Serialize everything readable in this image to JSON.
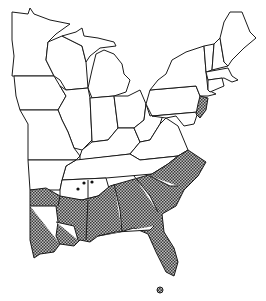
{
  "map": {
    "title": "Eastern United States range map",
    "legend": {
      "shaded_label": "Range (stippled)",
      "dot_label": "Isolated records"
    },
    "colors": {
      "outline": "#1a1a1a",
      "land": "#ffffff",
      "range_fill": "#8a8a8a"
    },
    "shaded_states": [
      "Texas (east)",
      "Louisiana",
      "Arkansas (south)",
      "Mississippi",
      "Alabama",
      "Georgia",
      "South Carolina",
      "North Carolina",
      "Florida",
      "Tennessee (south edge)",
      "New Jersey (south)",
      "Delaware"
    ],
    "isolated_points_count": 3
  }
}
